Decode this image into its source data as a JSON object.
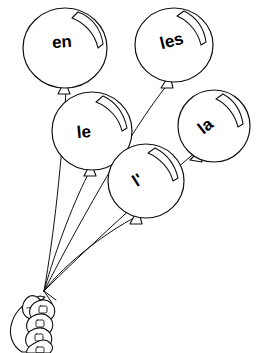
{
  "illustration": {
    "title": "Bunch of balloons held in a hand",
    "subject": "French articles on balloons",
    "background_color": "#ffffff",
    "line_color": "#111111",
    "text_color": "#000000"
  },
  "balloons": [
    {
      "id": "balloon-en",
      "label": "en",
      "cx": 65,
      "cy": 48,
      "rx": 42,
      "ry": 40,
      "label_x": 62,
      "label_y": 43,
      "label_rotation": -4,
      "font_size": 17,
      "highlight_rotation": 0
    },
    {
      "id": "balloon-les",
      "label": "les",
      "cx": 174,
      "cy": 45,
      "rx": 39,
      "ry": 37,
      "label_x": 172,
      "label_y": 42,
      "label_rotation": -14,
      "font_size": 16,
      "highlight_rotation": -4
    },
    {
      "id": "balloon-le",
      "label": "le",
      "cx": 92,
      "cy": 131,
      "rx": 40,
      "ry": 39,
      "label_x": 84,
      "label_y": 133,
      "label_rotation": -5,
      "font_size": 17,
      "highlight_rotation": 6
    },
    {
      "id": "balloon-la",
      "label": "la",
      "cx": 214,
      "cy": 126,
      "rx": 36,
      "ry": 36,
      "label_x": 206,
      "label_y": 127,
      "label_rotation": -38,
      "font_size": 16,
      "highlight_rotation": 8
    },
    {
      "id": "balloon-lapostrophe",
      "label": "l'",
      "cx": 146,
      "cy": 181,
      "rx": 38,
      "ry": 37,
      "label_x": 138,
      "label_y": 181,
      "label_rotation": -32,
      "font_size": 17,
      "highlight_rotation": 2
    }
  ],
  "strings": {
    "knot_point_x": 44,
    "knot_point_y": 291,
    "count": 5
  },
  "hand": {
    "label": "hand",
    "finger_count": 4,
    "thumb": "thumb"
  }
}
